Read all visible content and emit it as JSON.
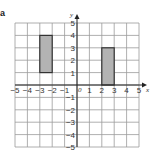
{
  "part_label": "a",
  "chart_data": {
    "type": "coordinate-grid",
    "title": "",
    "xlabel": "x",
    "ylabel": "y",
    "xlim": [
      -5,
      5
    ],
    "ylim": [
      -5,
      5
    ],
    "grid": true,
    "origin_label": "0",
    "x_tick_labels": [
      "-5",
      "-4",
      "-3",
      "-2",
      "-1",
      "1",
      "2",
      "3",
      "4",
      "5"
    ],
    "y_tick_labels": [
      "5",
      "4",
      "3",
      "2",
      "1",
      "-1",
      "-2",
      "-3",
      "-4",
      "-5"
    ],
    "shapes": [
      {
        "name": "rectangle-A",
        "type": "rectangle",
        "x0": -3,
        "x1": -2,
        "y0": 1,
        "y1": 4,
        "fill": "#b3b3b3",
        "stroke": "#333333"
      },
      {
        "name": "rectangle-B",
        "type": "rectangle",
        "x0": 2,
        "x1": 3,
        "y0": 0,
        "y1": 3,
        "fill": "#b3b3b3",
        "stroke": "#333333"
      }
    ]
  },
  "colors": {
    "grid": "#9a9a9a",
    "axis": "#222222",
    "shape_fill": "#b3b3b3",
    "shape_stroke": "#333333"
  }
}
